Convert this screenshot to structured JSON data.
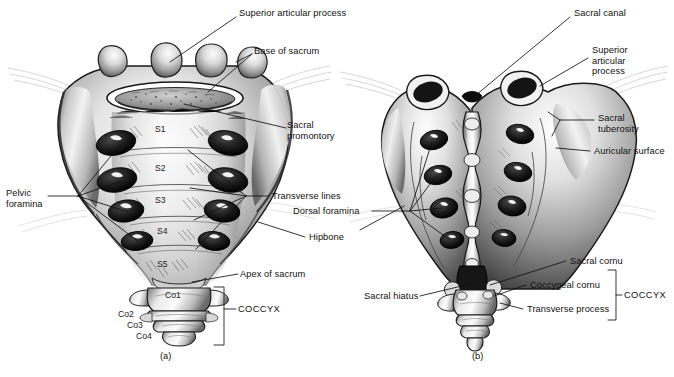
{
  "figure": {
    "background": "#ffffff",
    "ink": "#111111",
    "captions": [
      {
        "id": "a",
        "text": "(a)",
        "x": 160,
        "y": 352
      },
      {
        "id": "b",
        "text": "(b)",
        "x": 472,
        "y": 352
      }
    ]
  },
  "panel_a": {
    "view": "anterior",
    "labels": [
      {
        "name": "superior-articular-process",
        "text": "Superior articular process",
        "x": 239,
        "y": 12,
        "align": "left"
      },
      {
        "name": "base-of-sacrum",
        "text": "Base of sacrum",
        "x": 254,
        "y": 50,
        "align": "left"
      },
      {
        "name": "sacral-promontory",
        "text": "Sacral\npromontory",
        "x": 287,
        "y": 124,
        "align": "left"
      },
      {
        "name": "pelvic-foramina",
        "text": "Pelvic\nforamina",
        "x": 8,
        "y": 192,
        "align": "left"
      },
      {
        "name": "transverse-lines",
        "text": "Transverse lines",
        "x": 272,
        "y": 192,
        "align": "left"
      },
      {
        "name": "apex-of-sacrum",
        "text": "Apex of sacrum",
        "x": 240,
        "y": 270,
        "align": "left"
      },
      {
        "name": "coccyx-bracket-label",
        "text": "COCCYX",
        "x": 226,
        "y": 305,
        "align": "left"
      }
    ],
    "segment_labels": [
      {
        "name": "segment-s1",
        "text": "S1",
        "x": 155,
        "y": 129
      },
      {
        "name": "segment-s2",
        "text": "S2",
        "x": 155,
        "y": 168
      },
      {
        "name": "segment-s3",
        "text": "S3",
        "x": 155,
        "y": 199
      },
      {
        "name": "segment-s4",
        "text": "S4",
        "x": 157,
        "y": 230
      },
      {
        "name": "segment-s5",
        "text": "S5",
        "x": 157,
        "y": 263
      },
      {
        "name": "coccyx-co1",
        "text": "Co1",
        "x": 155,
        "y": 292
      },
      {
        "name": "coccyx-co2",
        "text": "Co2",
        "x": 124,
        "y": 312
      },
      {
        "name": "coccyx-co3",
        "text": "Co3",
        "x": 131,
        "y": 322
      },
      {
        "name": "coccyx-co4",
        "text": "Co4",
        "x": 138,
        "y": 332
      }
    ]
  },
  "panel_b": {
    "view": "posterior",
    "labels": [
      {
        "name": "sacral-canal",
        "text": "Sacral canal",
        "x": 573,
        "y": 12,
        "align": "left"
      },
      {
        "name": "superior-articular-process",
        "text": "Superior\narticular\nprocess",
        "x": 591,
        "y": 48,
        "align": "left"
      },
      {
        "name": "sacral-tuberosity",
        "text": "Sacral\ntuberosity",
        "x": 597,
        "y": 116,
        "align": "left"
      },
      {
        "name": "auricular-surface",
        "text": "Auricular surface",
        "x": 593,
        "y": 147,
        "align": "left"
      },
      {
        "name": "dorsal-foramina",
        "text": "Dorsal foramina",
        "x": 293,
        "y": 207,
        "align": "left"
      },
      {
        "name": "hipbone",
        "text": "Hipbone",
        "x": 309,
        "y": 233,
        "align": "left"
      },
      {
        "name": "sacral-cornu",
        "text": "Sacral cornu",
        "x": 570,
        "y": 257,
        "align": "left"
      },
      {
        "name": "coccygeal-cornu",
        "text": "Coccygeal cornu",
        "x": 530,
        "y": 281,
        "align": "left"
      },
      {
        "name": "transverse-process",
        "text": "Transverse process",
        "x": 527,
        "y": 305,
        "align": "left"
      },
      {
        "name": "sacral-hiatus",
        "text": "Sacral hiatus",
        "x": 366,
        "y": 292,
        "align": "left"
      },
      {
        "name": "coccyx-bracket-label",
        "text": "COCCYX",
        "x": 623,
        "y": 291,
        "align": "left"
      }
    ]
  }
}
